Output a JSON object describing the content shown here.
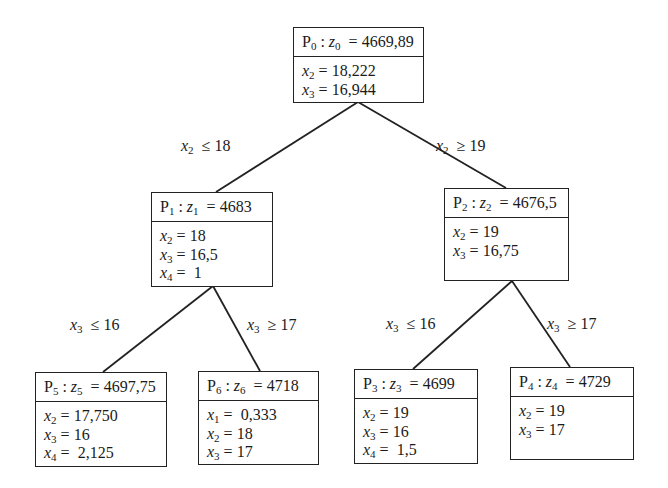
{
  "diagram": {
    "type": "branch-and-bound tree",
    "nodes": [
      {
        "id": "P0",
        "label": "P",
        "sub": "0",
        "zvar": "z",
        "zsub": "0",
        "zvalue": "4669,89",
        "vars": [
          {
            "name": "x",
            "sub": "2",
            "value": "18,222"
          },
          {
            "name": "x",
            "sub": "3",
            "value": "16,944"
          }
        ]
      },
      {
        "id": "P1",
        "label": "P",
        "sub": "1",
        "zvar": "z",
        "zsub": "1",
        "zvalue": "4683",
        "vars": [
          {
            "name": "x",
            "sub": "2",
            "value": "18"
          },
          {
            "name": "x",
            "sub": "3",
            "value": "16,5"
          },
          {
            "name": "x",
            "sub": "4",
            "value": " 1"
          }
        ]
      },
      {
        "id": "P2",
        "label": "P",
        "sub": "2",
        "zvar": "z",
        "zsub": "2",
        "zvalue": "4676,5",
        "vars": [
          {
            "name": "x",
            "sub": "2",
            "value": "19"
          },
          {
            "name": "x",
            "sub": "3",
            "value": "16,75"
          }
        ]
      },
      {
        "id": "P5",
        "label": "P",
        "sub": "5",
        "zvar": "z",
        "zsub": "5",
        "zvalue": "4697,75",
        "vars": [
          {
            "name": "x",
            "sub": "2",
            "value": "17,750"
          },
          {
            "name": "x",
            "sub": "3",
            "value": "16"
          },
          {
            "name": "x",
            "sub": "4",
            "value": " 2,125"
          }
        ]
      },
      {
        "id": "P6",
        "label": "P",
        "sub": "6",
        "zvar": "z",
        "zsub": "6",
        "zvalue": "4718",
        "vars": [
          {
            "name": "x",
            "sub": "1",
            "value": " 0,333"
          },
          {
            "name": "x",
            "sub": "2",
            "value": "18"
          },
          {
            "name": "x",
            "sub": "3",
            "value": "17"
          }
        ]
      },
      {
        "id": "P3",
        "label": "P",
        "sub": "3",
        "zvar": "z",
        "zsub": "3",
        "zvalue": "4699",
        "vars": [
          {
            "name": "x",
            "sub": "2",
            "value": "19"
          },
          {
            "name": "x",
            "sub": "3",
            "value": "16"
          },
          {
            "name": "x",
            "sub": "4",
            "value": " 1,5"
          }
        ]
      },
      {
        "id": "P4",
        "label": "P",
        "sub": "4",
        "zvar": "z",
        "zsub": "4",
        "zvalue": "4729",
        "vars": [
          {
            "name": "x",
            "sub": "2",
            "value": "19"
          },
          {
            "name": "x",
            "sub": "3",
            "value": "17"
          }
        ]
      }
    ],
    "edges": [
      {
        "from": "P0",
        "to": "P1",
        "var": "x",
        "sub": "2",
        "op": "≤",
        "bound": "18"
      },
      {
        "from": "P0",
        "to": "P2",
        "var": "x",
        "sub": "2",
        "op": "≥",
        "bound": "19"
      },
      {
        "from": "P1",
        "to": "P5",
        "var": "x",
        "sub": "3",
        "op": "≤",
        "bound": "16"
      },
      {
        "from": "P1",
        "to": "P6",
        "var": "x",
        "sub": "3",
        "op": "≥",
        "bound": "17"
      },
      {
        "from": "P2",
        "to": "P3",
        "var": "x",
        "sub": "3",
        "op": "≤",
        "bound": "16"
      },
      {
        "from": "P2",
        "to": "P4",
        "var": "x",
        "sub": "3",
        "op": "≥",
        "bound": "17"
      }
    ],
    "colon": ":",
    "equals": "="
  }
}
